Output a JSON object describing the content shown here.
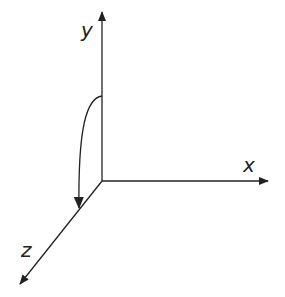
{
  "diagram": {
    "title": "",
    "axes": [
      {
        "name": "x",
        "label": "x"
      },
      {
        "name": "y",
        "label": "y"
      },
      {
        "name": "z",
        "label": "z"
      }
    ],
    "rotation_arrow": {
      "from": "y",
      "to": "z"
    },
    "colors": {
      "stroke": "#222222",
      "background": "#ffffff"
    }
  }
}
